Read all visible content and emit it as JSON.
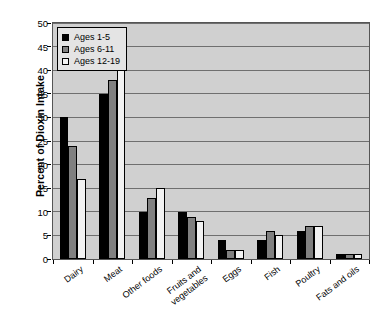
{
  "chart_data": {
    "type": "bar",
    "title": "",
    "xlabel": "",
    "ylabel": "Percent of Dioxin Intake",
    "ylim": [
      0,
      50
    ],
    "ytick_step": 5,
    "yticks": [
      0,
      5,
      10,
      15,
      20,
      25,
      30,
      35,
      40,
      45,
      50
    ],
    "grid": "horizontal",
    "legend_position": "top-left-inside",
    "categories": [
      "Dairy",
      "Meat",
      "Other foods",
      "Fruits and\nvegetables",
      "Eggs",
      "Fish",
      "Poultry",
      "Fats and oils"
    ],
    "series": [
      {
        "name": "Ages 1-5",
        "color": "#000000",
        "values": [
          30,
          35,
          10,
          10,
          4,
          4,
          6,
          1
        ]
      },
      {
        "name": "Ages 6-11",
        "color": "#808080",
        "values": [
          24,
          38,
          13,
          9,
          2,
          6,
          7,
          1
        ]
      },
      {
        "name": "Ages 12-19",
        "color": "#f2f2f2",
        "values": [
          17,
          45,
          15,
          8,
          2,
          5,
          7,
          1
        ]
      }
    ]
  },
  "legend": {
    "items": [
      {
        "label": "Ages 1-5",
        "color": "#000000"
      },
      {
        "label": "Ages 6-11",
        "color": "#808080"
      },
      {
        "label": "Ages 12-19",
        "color": "#f2f2f2"
      }
    ]
  },
  "axes": {
    "y_title": "Percent of Dioxin Intake",
    "y_tick_labels": [
      "50",
      "45",
      "40",
      "35",
      "30",
      "25",
      "20",
      "15",
      "10",
      "5",
      "0"
    ],
    "x_tick_labels": [
      "Dairy",
      "Meat",
      "Other foods",
      "Fruits and\nvegetables",
      "Eggs",
      "Fish",
      "Poultry",
      "Fats and oils"
    ]
  },
  "colors": {
    "plot_background": "#d0d0d0",
    "gridline": "#6f6f6f",
    "axis": "#000000",
    "page_background": "#ffffff"
  }
}
